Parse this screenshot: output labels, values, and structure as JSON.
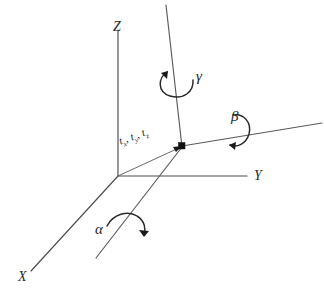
{
  "figure": {
    "background_color": "#ffffff",
    "line_color": "#4c4c4c",
    "label_color": "#2b2b2b"
  },
  "axes": [
    {
      "id": "x",
      "label": "X",
      "description": "world X axis toward lower-left"
    },
    {
      "id": "y",
      "label": "Y",
      "description": "world Y axis toward right"
    },
    {
      "id": "z",
      "label": "Z",
      "description": "world Z axis toward top"
    }
  ],
  "rotations": [
    {
      "id": "alpha",
      "label": "α",
      "about": "X",
      "arrow": "curved-arrow-clockwise"
    },
    {
      "id": "beta",
      "label": "β",
      "about": "Y",
      "arrow": "curved-arrow-clockwise"
    },
    {
      "id": "gamma",
      "label": "γ",
      "about": "Z",
      "arrow": "curved-arrow-counterclockwise"
    }
  ],
  "translations": [
    {
      "id": "tx",
      "symbol": "t",
      "subscript": "x",
      "separator": ","
    },
    {
      "id": "ty",
      "symbol": "t",
      "subscript": "y",
      "separator": ","
    },
    {
      "id": "tz",
      "symbol": "t",
      "subscript": "z",
      "separator": ""
    }
  ],
  "markers": [
    {
      "id": "world-origin",
      "name": "world-origin"
    },
    {
      "id": "local-origin",
      "name": "translated-frame-origin",
      "shape": "square",
      "color": "#111111"
    }
  ]
}
